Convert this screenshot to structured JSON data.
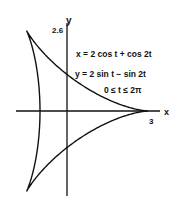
{
  "figure": {
    "axis_x_label": "x",
    "axis_y_label": "y",
    "y_tick_label": "2.6",
    "x_tick_label": "3",
    "equations": [
      "x = 2 cos t + cos 2t",
      "y = 2 sin t − sin 2t",
      "0 ≤ t ≤ 2π"
    ],
    "curve_color": "#111111",
    "axis_color": "#111111"
  },
  "chart_data": {
    "type": "line",
    "title": "",
    "xlabel": "x",
    "ylabel": "y",
    "curve": "deltoid",
    "parametric": {
      "x": "2 cos t + cos 2t",
      "y": "2 sin t - sin 2t",
      "t_range": [
        0,
        6.2832
      ]
    },
    "cusps": [
      [
        3,
        0
      ],
      [
        -1.5,
        2.6
      ],
      [
        -1.5,
        -2.6
      ]
    ],
    "tick_labels": {
      "x": [
        "3"
      ],
      "y": [
        "2.6"
      ]
    },
    "annotations": [
      "x = 2 cos t + cos 2t",
      "y = 2 sin t − sin 2t",
      "0 ≤ t ≤ 2π"
    ]
  }
}
